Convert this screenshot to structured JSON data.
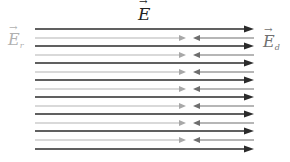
{
  "diagram": {
    "type": "superposition of electric fields between plates",
    "labels": {
      "total_field": {
        "symbol": "E",
        "subscript": ""
      },
      "reflected_field": {
        "symbol": "E",
        "subscript": "r"
      },
      "direct_field": {
        "symbol": "E",
        "subscript": "d"
      }
    },
    "colors": {
      "total_field_line": "#2b2b2b",
      "reflected_field_line": "#b4b4b4",
      "reflected_arrow": "#a8a8a8",
      "direct_arrow": "#6e6e6e",
      "background": "#ffffff"
    },
    "geometry": {
      "x_start": 35,
      "x_end": 254,
      "er_arrow_x": 186,
      "ed_arrow_x": 193
    },
    "dark_lines_y": [
      29,
      46,
      63,
      80,
      97,
      114,
      131,
      149
    ],
    "light_lines_y": [
      38,
      55,
      72,
      89,
      106,
      123,
      140
    ]
  }
}
